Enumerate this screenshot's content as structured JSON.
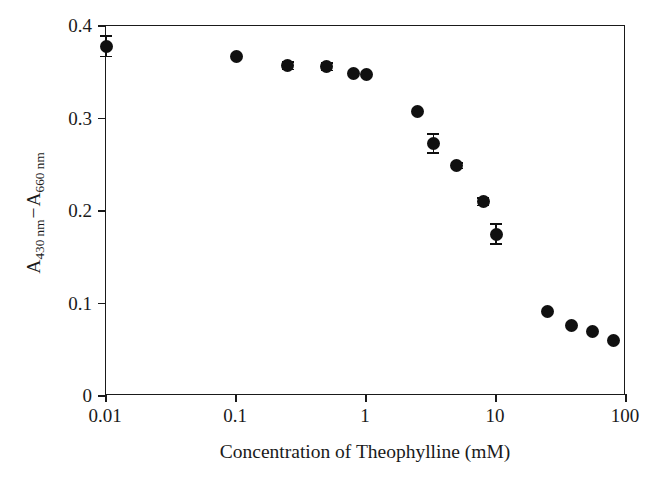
{
  "chart_data": {
    "type": "scatter",
    "title": "",
    "xlabel": "Concentration of Theophylline (mM)",
    "ylabel": "A430 nm − A660 nm",
    "ylabel_parts": {
      "a1": "A",
      "sub1": "430 nm",
      "dash": "−",
      "a2": "A",
      "sub2": "660 nm"
    },
    "xscale": "log",
    "yscale": "linear",
    "xlim": [
      0.01,
      100
    ],
    "ylim": [
      0,
      0.4
    ],
    "grid": false,
    "legend": null,
    "marker": "filled-circle",
    "marker_color": "#101010",
    "xticks": [
      "0.01",
      "0.1",
      "1",
      "10",
      "100"
    ],
    "xtick_values": [
      0.01,
      0.1,
      1,
      10,
      100
    ],
    "yticks": [
      "0",
      "0.1",
      "0.2",
      "0.3",
      "0.4"
    ],
    "ytick_values": [
      0,
      0.1,
      0.2,
      0.3,
      0.4
    ],
    "x": [
      0.01,
      0.1,
      0.25,
      0.5,
      0.8,
      1.0,
      2.5,
      3.3,
      5.0,
      8.0,
      10.0,
      25.0,
      38.0,
      55.0,
      80.0
    ],
    "y": [
      0.378,
      0.367,
      0.357,
      0.356,
      0.349,
      0.348,
      0.308,
      0.273,
      0.249,
      0.21,
      0.175,
      0.091,
      0.076,
      0.07,
      0.06
    ],
    "yerr": [
      0.012,
      0.0,
      0.005,
      0.005,
      0.0,
      0.0,
      0.0,
      0.011,
      0.004,
      0.005,
      0.012,
      0.0,
      0.0,
      0.0,
      0.0
    ],
    "points": [
      {
        "x": 0.01,
        "y": 0.378,
        "yerr": 0.012
      },
      {
        "x": 0.1,
        "y": 0.367,
        "yerr": 0.0
      },
      {
        "x": 0.25,
        "y": 0.357,
        "yerr": 0.005
      },
      {
        "x": 0.5,
        "y": 0.356,
        "yerr": 0.005
      },
      {
        "x": 0.8,
        "y": 0.349,
        "yerr": 0.0
      },
      {
        "x": 1.0,
        "y": 0.348,
        "yerr": 0.0
      },
      {
        "x": 2.5,
        "y": 0.308,
        "yerr": 0.0
      },
      {
        "x": 3.3,
        "y": 0.273,
        "yerr": 0.011
      },
      {
        "x": 5.0,
        "y": 0.249,
        "yerr": 0.004
      },
      {
        "x": 8.0,
        "y": 0.21,
        "yerr": 0.005
      },
      {
        "x": 10.0,
        "y": 0.175,
        "yerr": 0.012
      },
      {
        "x": 25.0,
        "y": 0.091,
        "yerr": 0.0
      },
      {
        "x": 38.0,
        "y": 0.076,
        "yerr": 0.0
      },
      {
        "x": 55.0,
        "y": 0.07,
        "yerr": 0.0
      },
      {
        "x": 80.0,
        "y": 0.06,
        "yerr": 0.0
      }
    ]
  },
  "style": {
    "axis_color": "#1a1a1a",
    "marker_color": "#101010",
    "background": "#ffffff"
  }
}
